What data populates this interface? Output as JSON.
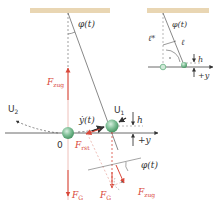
{
  "colors": {
    "ceiling": "#e9d6b3",
    "line": "#555555",
    "axis": "#444444",
    "force": "#d9483a",
    "force_light": "#eab0a8",
    "bob": "#7fbf96",
    "bob_dark": "#3f8f5c",
    "velocity": "#222222"
  },
  "main": {
    "angle_label": "φ(t)",
    "tension_label": "F",
    "tension_sub": "zug",
    "u2_label": "U",
    "u2_sub": "2",
    "u1_label": "U",
    "u1_sub": "1",
    "origin_label": "0",
    "velocity_label": "ẏ(t)",
    "restoring_label": "F",
    "restoring_sub": "rst",
    "gravity_label": "F",
    "gravity_sub": "G",
    "gravity2_label": "F",
    "gravity2_sub": "G",
    "tension2_label": "F",
    "tension2_sub": "zug",
    "angle2_label": "φ(t)",
    "height_label": "h",
    "axis_label": "+y"
  },
  "inset": {
    "angle_label": "φ(t)",
    "length_label": "ℓ",
    "length_star_label": "ℓ*",
    "height_label": "h",
    "axis_label": "+y"
  }
}
